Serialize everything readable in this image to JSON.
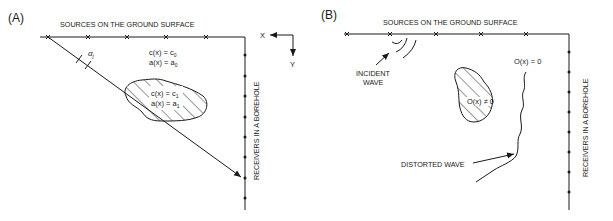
{
  "panels": [
    {
      "id": "A",
      "label": "(A)",
      "sources_label": "SOURCES ON THE GROUND SURFACE",
      "receivers_label": "RECEIVERS IN A BOREHOLE",
      "angle_symbol": "α",
      "angle_subscript": "j",
      "background_eq1": "c(x) = c",
      "background_eq1_sub": "0",
      "background_eq2": "a(x) = a",
      "background_eq2_sub": "0",
      "anomaly_eq1": "c(x) = c",
      "anomaly_eq1_sub": "1",
      "anomaly_eq2": "a(x) = a",
      "anomaly_eq2_sub": "1",
      "axis_x": "X",
      "axis_y": "Y"
    },
    {
      "id": "B",
      "label": "(B)",
      "sources_label": "SOURCES ON THE GROUND SURFACE",
      "receivers_label": "RECEIVERS IN A BOREHOLE",
      "incident_wave_line1": "INCIDENT",
      "incident_wave_line2": "WAVE",
      "distorted_wave": "DISTORTED WAVE",
      "background_eq": "O(x) = 0",
      "anomaly_eq": "O(x) ≠ 0"
    }
  ],
  "colors": {
    "ink": "#1a1a1a",
    "background": "#ffffff"
  }
}
